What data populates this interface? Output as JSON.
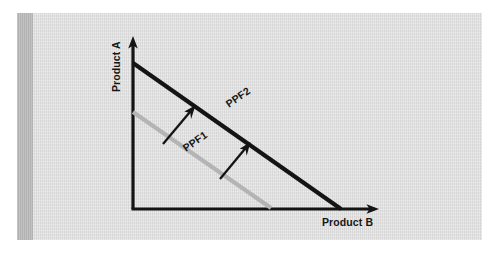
{
  "figure": {
    "kind": "ppf-outward-shift-diagram",
    "panel_background": "#dcdcdc",
    "spine_color": "#b6b6b6",
    "page_background": "#ffffff"
  },
  "axes": {
    "y_label": "Product A",
    "x_label": "Product B",
    "color": "#141414",
    "origin": {
      "x": 133,
      "y": 209
    },
    "y_tip": {
      "x": 133,
      "y": 38
    },
    "x_tip": {
      "x": 378,
      "y": 209
    }
  },
  "curves": [
    {
      "name": "PPF1",
      "label": "PPF1",
      "color": "#b4b4b4",
      "start": {
        "x": 133,
        "y": 112
      },
      "end": {
        "x": 271,
        "y": 208
      },
      "label_pos": {
        "x": 186,
        "y": 152
      },
      "label_rotation": -34.8
    },
    {
      "name": "PPF2",
      "label": "PPF2",
      "color": "#141414",
      "start": {
        "x": 133,
        "y": 63
      },
      "end": {
        "x": 341,
        "y": 209
      },
      "label_pos": {
        "x": 229,
        "y": 108
      },
      "label_rotation": -35.0
    }
  ],
  "shift_arrows": [
    {
      "name": "shift-arrow-left",
      "from": {
        "x": 163,
        "y": 144
      },
      "to": {
        "x": 194,
        "y": 107
      }
    },
    {
      "name": "shift-arrow-right",
      "from": {
        "x": 220,
        "y": 179
      },
      "to": {
        "x": 249,
        "y": 144
      }
    }
  ],
  "labels": {
    "y_axis_label_pos": {
      "x": 120,
      "y": 92
    },
    "x_axis_label_pos": {
      "x": 322,
      "y": 226
    }
  }
}
